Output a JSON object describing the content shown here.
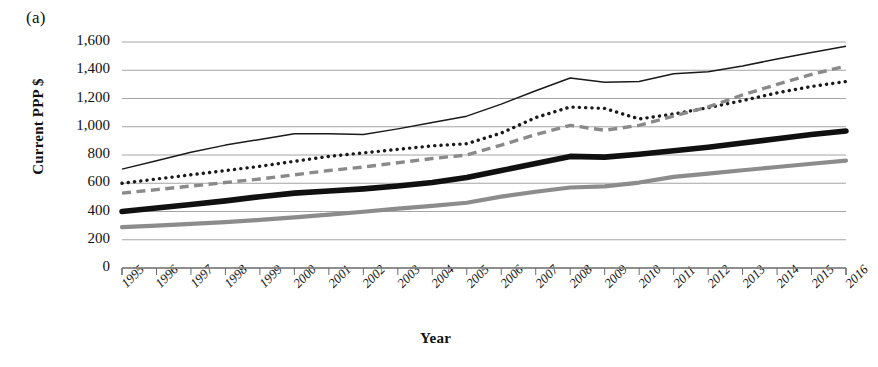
{
  "panel": {
    "label": "(a)"
  },
  "axes": {
    "ylabel": "Current PPP $",
    "xlabel": "Year",
    "yticks": [
      "1,600",
      "1,400",
      "1,200",
      "1,000",
      "800",
      "600",
      "400",
      "200",
      "0"
    ],
    "ytick_values": [
      1600,
      1400,
      1200,
      1000,
      800,
      600,
      400,
      200,
      0
    ],
    "ylim": [
      0,
      1600
    ],
    "grid": true
  },
  "chart_data": {
    "type": "line",
    "title": "",
    "xlabel": "Year",
    "ylabel": "Current PPP $",
    "ylim": [
      0,
      1600
    ],
    "grid": true,
    "legend": "none",
    "categories": [
      "1995",
      "1996",
      "1997",
      "1998",
      "1999",
      "2000",
      "2001",
      "2002",
      "2003",
      "2004",
      "2005",
      "2006",
      "2007",
      "2008",
      "2009",
      "2010",
      "2011",
      "2012",
      "2013",
      "2014",
      "2015",
      "2016"
    ],
    "series": [
      {
        "name": "series-thin-solid",
        "style": "thin-solid-black",
        "color": "#1a1a1a",
        "values": [
          700,
          760,
          820,
          870,
          910,
          950,
          950,
          945,
          985,
          1030,
          1075,
          1160,
          1255,
          1345,
          1315,
          1320,
          1375,
          1390,
          1430,
          1480,
          1525,
          1570
        ]
      },
      {
        "name": "series-dotted",
        "style": "dotted-black",
        "color": "#1a1a1a",
        "values": [
          600,
          630,
          660,
          690,
          720,
          755,
          790,
          815,
          840,
          865,
          880,
          955,
          1065,
          1140,
          1130,
          1055,
          1090,
          1135,
          1185,
          1240,
          1285,
          1320
        ]
      },
      {
        "name": "series-dashed",
        "style": "dashed-gray",
        "color": "#8a8a8a",
        "values": [
          530,
          555,
          580,
          605,
          630,
          660,
          690,
          715,
          745,
          775,
          800,
          870,
          945,
          1010,
          975,
          1010,
          1075,
          1140,
          1225,
          1300,
          1370,
          1430
        ]
      },
      {
        "name": "series-thick-solid",
        "style": "thick-solid-black",
        "color": "#101010",
        "values": [
          400,
          425,
          450,
          475,
          505,
          530,
          545,
          560,
          580,
          605,
          640,
          690,
          740,
          790,
          785,
          805,
          830,
          855,
          885,
          915,
          945,
          970
        ]
      },
      {
        "name": "series-gray-solid",
        "style": "medium-gray-solid",
        "color": "#8c8c8c",
        "values": [
          290,
          300,
          312,
          325,
          340,
          358,
          378,
          398,
          420,
          440,
          462,
          505,
          540,
          570,
          578,
          605,
          645,
          668,
          692,
          715,
          738,
          760
        ]
      }
    ]
  }
}
